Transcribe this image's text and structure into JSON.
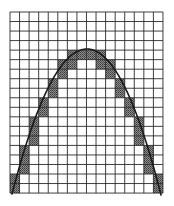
{
  "figure": {
    "grid": {
      "columns": 16,
      "rows": 19,
      "origin_x": 10,
      "origin_y": 12,
      "cell_width": 9.56,
      "cell_height": 9.53,
      "line_color": "#2a2a2a"
    },
    "shaded_cells": [
      {
        "row": 4,
        "cols": [
          6,
          7,
          8,
          9
        ]
      },
      {
        "row": 5,
        "cols": [
          5,
          6,
          9,
          10
        ]
      },
      {
        "row": 6,
        "cols": [
          5,
          10
        ]
      },
      {
        "row": 7,
        "cols": [
          4,
          11
        ]
      },
      {
        "row": 8,
        "cols": [
          4,
          11
        ]
      },
      {
        "row": 9,
        "cols": [
          3,
          12
        ]
      },
      {
        "row": 10,
        "cols": [
          3,
          12
        ]
      },
      {
        "row": 11,
        "cols": [
          2,
          13
        ]
      },
      {
        "row": 12,
        "cols": [
          2,
          13
        ]
      },
      {
        "row": 13,
        "cols": [
          2,
          13
        ]
      },
      {
        "row": 14,
        "cols": [
          1,
          14
        ]
      },
      {
        "row": 15,
        "cols": [
          1,
          14
        ]
      },
      {
        "row": 16,
        "cols": [
          1,
          14
        ]
      },
      {
        "row": 17,
        "cols": [
          0,
          15
        ]
      },
      {
        "row": 18,
        "cols": [
          0,
          15
        ]
      }
    ],
    "shade_color": "#6e6e6e",
    "curve": {
      "type": "parabola",
      "apex": [
        87,
        49
      ],
      "left_end": [
        12,
        194
      ],
      "right_end": [
        161,
        195
      ],
      "color": "#1a1a1a",
      "stroke_width": 1.6
    }
  }
}
